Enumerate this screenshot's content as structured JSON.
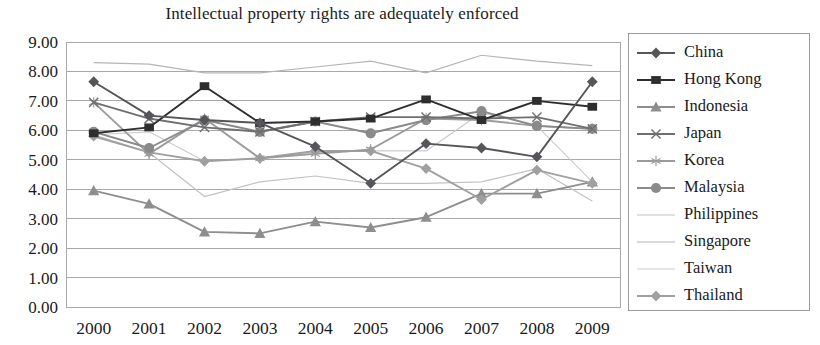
{
  "chart_data": {
    "type": "line",
    "title": "Intellectual property rights are adequately enforced",
    "xlabel": "",
    "ylabel": "",
    "ylim": [
      0,
      9
    ],
    "ytick_step": 1,
    "ytick_labels": [
      "9.00",
      "8.00",
      "7.00",
      "6.00",
      "5.00",
      "4.00",
      "3.00",
      "2.00",
      "1.00",
      "0.00"
    ],
    "grid": true,
    "legend_position": "right",
    "categories": [
      "2000",
      "2001",
      "2002",
      "2003",
      "2004",
      "2005",
      "2006",
      "2007",
      "2008",
      "2009"
    ],
    "series": [
      {
        "name": "China",
        "marker": "diamond",
        "color": "#55565a",
        "values": [
          7.65,
          6.5,
          6.35,
          6.25,
          5.45,
          4.2,
          5.55,
          5.4,
          5.1,
          7.65
        ]
      },
      {
        "name": "Hong Kong",
        "marker": "square",
        "color": "#2e2e2e",
        "values": [
          5.9,
          6.1,
          7.5,
          6.25,
          6.3,
          6.4,
          7.05,
          6.35,
          7.0,
          6.8
        ]
      },
      {
        "name": "Indonesia",
        "marker": "triangle",
        "color": "#8e8e8e",
        "values": [
          3.95,
          3.5,
          2.55,
          2.5,
          2.9,
          2.7,
          3.05,
          3.85,
          3.85,
          4.25
        ]
      },
      {
        "name": "Japan",
        "marker": "x",
        "color": "#6f6f6f",
        "values": [
          6.95,
          6.4,
          6.1,
          5.95,
          6.3,
          6.45,
          6.45,
          6.4,
          6.45,
          6.05
        ]
      },
      {
        "name": "Korea",
        "marker": "asterisk",
        "color": "#9b9b9b",
        "values": [
          6.95,
          5.2,
          6.4,
          5.05,
          5.2,
          5.35,
          6.4,
          6.35,
          6.15,
          6.05
        ]
      },
      {
        "name": "Malaysia",
        "marker": "circle",
        "color": "#8a8a8a",
        "values": [
          5.95,
          5.4,
          6.35,
          5.95,
          6.3,
          5.9,
          6.35,
          6.65,
          6.15,
          6.05
        ]
      },
      {
        "name": "Philippines",
        "marker": "none",
        "color": "#c2c2c2",
        "values": [
          5.85,
          5.25,
          3.75,
          4.25,
          4.45,
          4.2,
          4.2,
          4.25,
          4.7,
          3.6
        ]
      },
      {
        "name": "Singapore",
        "marker": "none",
        "color": "#b5b5b5",
        "values": [
          8.3,
          8.25,
          7.95,
          7.95,
          8.15,
          8.35,
          7.95,
          8.55,
          8.35,
          8.2
        ]
      },
      {
        "name": "Taiwan",
        "marker": "none",
        "color": "#cccccc",
        "values": [
          5.85,
          5.95,
          4.95,
          5.05,
          5.25,
          5.3,
          5.3,
          6.6,
          6.15,
          4.25
        ]
      },
      {
        "name": "Thailand",
        "marker": "diamond",
        "color": "#a0a0a0",
        "values": [
          5.8,
          5.25,
          4.95,
          5.05,
          5.3,
          5.3,
          4.7,
          3.65,
          4.65,
          4.2
        ]
      }
    ]
  }
}
